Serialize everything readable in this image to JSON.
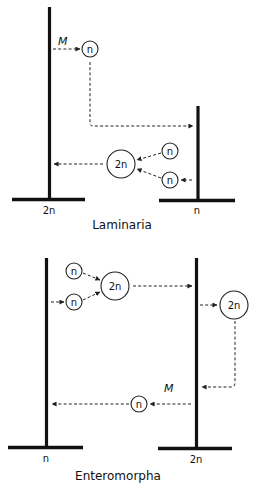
{
  "diagrams": [
    {
      "title": "Laminaria",
      "left_plant": {
        "ploidy_label": "2n"
      },
      "right_plant": {
        "ploidy_label": "n"
      },
      "meiosis_label": "M",
      "spore": "n",
      "gametes": [
        "n",
        "n"
      ],
      "zygote": "2n"
    },
    {
      "title": "Enteromorpha",
      "left_plant": {
        "ploidy_label": "n"
      },
      "right_plant": {
        "ploidy_label": "2n"
      },
      "meiosis_label": "M",
      "gametes": [
        "n",
        "n"
      ],
      "zygote": "2n",
      "released_zygote": "2n",
      "spore": "n"
    }
  ]
}
